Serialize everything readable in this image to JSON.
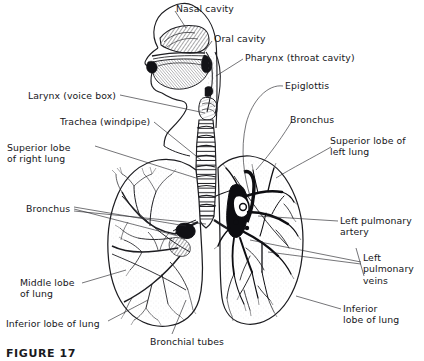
{
  "figure": {
    "caption": "FIGURE 17",
    "background_color": "#ffffff",
    "ink_color": "#16161a",
    "leader_color": "#2a2a2e"
  },
  "labels": [
    {
      "id": "nasal-cavity",
      "text": "Nasal cavity",
      "x": 176,
      "y": 3,
      "align": "left"
    },
    {
      "id": "oral-cavity",
      "text": "Oral cavity",
      "x": 214,
      "y": 33,
      "align": "left"
    },
    {
      "id": "pharynx",
      "text": "Pharynx (throat cavity)",
      "x": 245,
      "y": 52,
      "align": "left"
    },
    {
      "id": "epiglottis",
      "text": "Epiglottis",
      "x": 285,
      "y": 80,
      "align": "left"
    },
    {
      "id": "larynx",
      "text": "Larynx (voice box)",
      "x": 28,
      "y": 90,
      "align": "left"
    },
    {
      "id": "trachea",
      "text": "Trachea (windpipe)",
      "x": 60,
      "y": 116,
      "align": "left"
    },
    {
      "id": "bronchus-right",
      "text": "Bronchus",
      "x": 290,
      "y": 114,
      "align": "left"
    },
    {
      "id": "superior-lobe-right",
      "text": "Superior lobe\nof right lung",
      "x": 7,
      "y": 142,
      "align": "left"
    },
    {
      "id": "superior-lobe-left",
      "text": "Superior lobe of\nleft lung",
      "x": 330,
      "y": 135,
      "align": "left"
    },
    {
      "id": "bronchus-left",
      "text": "Bronchus",
      "x": 26,
      "y": 203,
      "align": "left"
    },
    {
      "id": "left-pulmonary-artery",
      "text": "Left pulmonary\nartery",
      "x": 340,
      "y": 215,
      "align": "left"
    },
    {
      "id": "left-pulmonary-veins",
      "text": "Left\npulmonary\nveins",
      "x": 363,
      "y": 252,
      "align": "left"
    },
    {
      "id": "middle-lobe",
      "text": "Middle lobe\nof lung",
      "x": 20,
      "y": 277,
      "align": "left"
    },
    {
      "id": "inferior-lobe-left-side",
      "text": "Inferior lobe of lung",
      "x": 6,
      "y": 318,
      "align": "left"
    },
    {
      "id": "inferior-lobe-right-side",
      "text": "Inferior\nlobe of lung",
      "x": 343,
      "y": 303,
      "align": "left"
    },
    {
      "id": "bronchial-tubes",
      "text": "Bronchial tubes",
      "x": 150,
      "y": 336,
      "align": "left"
    }
  ],
  "anatomy_parts": [
    "nasal-cavity",
    "oral-cavity",
    "pharynx",
    "epiglottis",
    "larynx",
    "trachea",
    "bronchus",
    "right-lung",
    "left-lung",
    "superior-lobe-right-lung",
    "middle-lobe-right-lung",
    "inferior-lobe-right-lung",
    "superior-lobe-left-lung",
    "inferior-lobe-left-lung",
    "bronchial-tubes",
    "left-pulmonary-artery",
    "left-pulmonary-veins"
  ]
}
